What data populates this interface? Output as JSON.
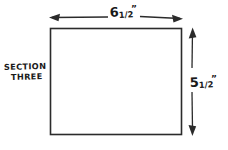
{
  "diagram": {
    "title_label": {
      "line1": "SECTION",
      "line2": "THREE"
    },
    "shape": {
      "name": "rectangle",
      "fill": "#ffffff",
      "stroke": "#2b2b2b"
    },
    "dimensions": {
      "width": {
        "whole": "6",
        "fraction": "1/2",
        "unit": "”",
        "full_text": "6½”",
        "orientation": "horizontal",
        "position": "top"
      },
      "height": {
        "whole": "5",
        "fraction": "1/2",
        "unit": "”",
        "full_text": "5½”",
        "orientation": "vertical",
        "position": "right"
      }
    },
    "colors": {
      "background": "#ffffff",
      "ink": "#2b2b2b",
      "text": "#1a1a1a"
    }
  }
}
